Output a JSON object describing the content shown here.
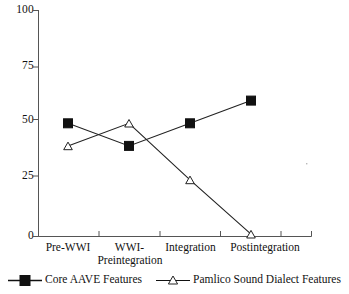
{
  "chart_data": {
    "type": "line",
    "title": "",
    "subtitle": "",
    "xlabel": "",
    "ylabel": "",
    "ylim": [
      0,
      100
    ],
    "yticks": [
      0,
      25,
      50,
      75,
      100
    ],
    "ytick_labels": [
      "0",
      "25",
      "50",
      "75",
      "100"
    ],
    "grid": false,
    "legend_position": "bottom",
    "categories": [
      "Pre-WWI",
      "WWI-Preintegration",
      "Integration",
      "Postintegration"
    ],
    "series": [
      {
        "name": "Core AAVE Features",
        "marker": "filled-square",
        "marker_color": "#111111",
        "line_color": "#111111",
        "values": [
          50,
          40,
          50,
          60
        ]
      },
      {
        "name": "Pamlico Sound Dialect Features",
        "marker": "open-triangle",
        "marker_color": "#ffffff",
        "line_color": "#111111",
        "values": [
          40,
          50,
          25,
          1
        ]
      }
    ]
  },
  "axes": {
    "y_tick_labels": [
      "100",
      "75",
      "50",
      "25",
      "0"
    ],
    "x_tick_labels": [
      "Pre-WWI",
      "WWI-",
      "Preintegration",
      "Integration",
      "Postintegration"
    ]
  },
  "legend": {
    "entries": [
      {
        "label": "Core AAVE Features",
        "marker": "filled-square"
      },
      {
        "label": "Pamlico Sound Dialect Features",
        "marker": "open-triangle"
      }
    ]
  }
}
